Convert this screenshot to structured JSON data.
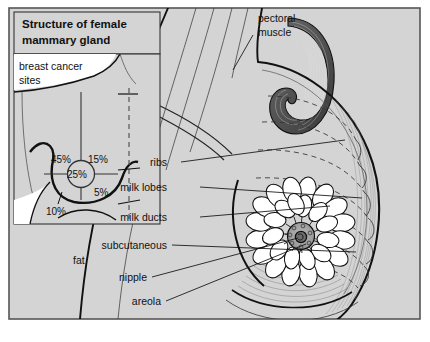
{
  "figure": {
    "background_color": "#d4d4d4",
    "frame_color": "#555555",
    "ink_color": "#111111",
    "page_color": "#ffffff"
  },
  "inset": {
    "title_line1": "Structure of female",
    "title_line2": "mammary gland",
    "caption_line1": "breast cancer",
    "caption_line2": "sites",
    "quadrants": [
      {
        "name": "upper-outer",
        "value": "45%"
      },
      {
        "name": "upper-inner",
        "value": "15%"
      },
      {
        "name": "central",
        "value": "25%"
      },
      {
        "name": "lower-inner",
        "value": "5%"
      },
      {
        "name": "lower-outer",
        "value": "10%"
      }
    ]
  },
  "labels": {
    "pectoral_line1": "pectoral",
    "pectoral_line2": "muscle",
    "ribs": "ribs",
    "milk_lobes": "milk lobes",
    "milk_ducts": "milk ducts",
    "subcutaneous_line1": "subcutaneous",
    "subcutaneous_line2": "fat",
    "nipple": "nipple",
    "areola": "areola"
  }
}
